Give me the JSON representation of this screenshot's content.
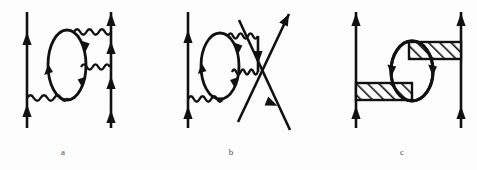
{
  "figure": {
    "type": "feynman-diagram-set",
    "background_color": "#fdfdfd",
    "stroke_color": "#111111",
    "label_color": "#4c4c4c",
    "width": 477,
    "height": 170,
    "panels": [
      {
        "id": "a",
        "label": "a",
        "label_x": 60,
        "label_y": 153,
        "description": "Two vertical fermion lines joined by three photon (wavy) lines with a closed fermion loop (vacuum polarization bubble) inserted between them",
        "elements": {
          "fermion_lines": [
            {
              "name": "left-fermion-line",
              "x": 27,
              "y1": 12,
              "y2": 128,
              "direction": "up",
              "arrows_y": [
                42,
                112
              ]
            },
            {
              "name": "right-fermion-line",
              "x": 111,
              "y1": 12,
              "y2": 128,
              "direction": "up",
              "arrows_y": [
                22,
                50,
                82,
                118
              ]
            }
          ],
          "photon_lines": [
            {
              "name": "upper-photon",
              "x1": 74,
              "x2": 111,
              "y": 32
            },
            {
              "name": "middle-photon",
              "x1": 81,
              "x2": 111,
              "y": 67
            },
            {
              "name": "lower-photon",
              "x1": 27,
              "x2": 68,
              "y": 98
            }
          ],
          "loops": [
            {
              "name": "fermion-loop",
              "cx": 67,
              "cy": 65,
              "rx": 19,
              "ry": 35,
              "arrow_count": 3
            }
          ]
        }
      },
      {
        "id": "b",
        "label": "b",
        "label_x": 228,
        "label_y": 153,
        "description": "Vertical fermion line on the left, fermion loop with photon exchanges, and two crossing diagonal fermion lines on the right forming an X",
        "elements": {
          "fermion_lines": [
            {
              "name": "left-fermion-line",
              "x": 188,
              "y1": 12,
              "y2": 128,
              "direction": "up",
              "arrows_y": [
                40,
                114
              ]
            },
            {
              "name": "diagonal-fermion-up",
              "x1": 238,
              "y1": 120,
              "x2": 288,
              "y2": 14,
              "direction": "up-right"
            },
            {
              "name": "diagonal-fermion-down",
              "x1": 288,
              "y1": 128,
              "x2": 240,
              "y2": 20,
              "direction": "down-right"
            },
            {
              "name": "short-vertical-connector",
              "x": 258,
              "y1": 36,
              "y2": 72,
              "direction": "down",
              "arrows_y": [
                58
              ]
            }
          ],
          "photon_lines": [
            {
              "name": "upper-photon",
              "x1": 228,
              "x2": 258,
              "y": 36
            },
            {
              "name": "middle-photon",
              "x1": 232,
              "x2": 258,
              "y": 72
            },
            {
              "name": "lower-photon",
              "x1": 188,
              "x2": 222,
              "y": 99
            }
          ],
          "loops": [
            {
              "name": "fermion-loop",
              "cx": 220,
              "cy": 66,
              "rx": 19,
              "ry": 33,
              "arrow_count": 3
            }
          ],
          "crossing_point": {
            "name": "vertex-crossing",
            "x": 263,
            "y": 57
          }
        }
      },
      {
        "id": "c",
        "label": "c",
        "label_x": 400,
        "label_y": 153,
        "description": "Two vertical fermion lines joined by two hatched (shaded) interaction blocks with a closed fermion loop between them",
        "elements": {
          "fermion_lines": [
            {
              "name": "left-fermion-line",
              "x": 356,
              "y1": 12,
              "y2": 128,
              "direction": "up",
              "arrows_y": [
                24,
                118
              ]
            },
            {
              "name": "right-fermion-line",
              "x": 461,
              "y1": 12,
              "y2": 128,
              "direction": "up",
              "arrows_y": [
                24,
                118
              ]
            }
          ],
          "hatched_blocks": [
            {
              "name": "upper-hatched-block",
              "x": 410,
              "y": 42,
              "width": 51,
              "height": 17,
              "hatch": "forward-slash"
            },
            {
              "name": "lower-hatched-block",
              "x": 356,
              "y": 83,
              "width": 55,
              "height": 17,
              "hatch": "forward-slash"
            }
          ],
          "loops": [
            {
              "name": "fermion-loop",
              "cx": 412,
              "cy": 71,
              "rx": 21,
              "ry": 30,
              "arrow_count": 2
            }
          ]
        }
      }
    ]
  }
}
